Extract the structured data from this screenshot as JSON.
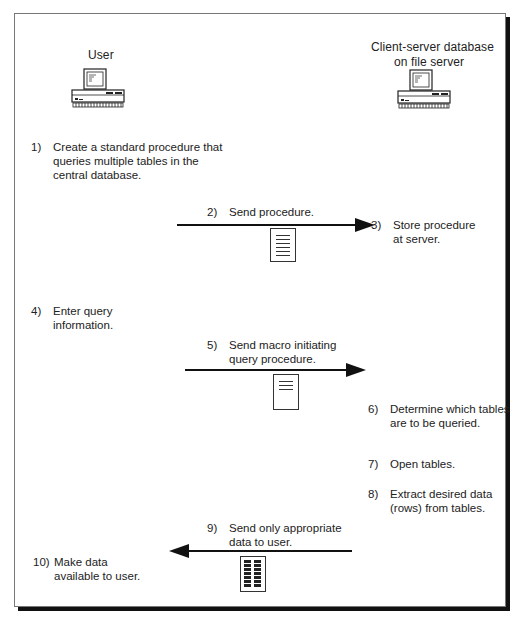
{
  "nodes": {
    "user": {
      "label": "User",
      "icon": "computer-icon"
    },
    "server": {
      "label_line1": "Client-server database",
      "label_line2": "on file server",
      "icon": "computer-icon"
    }
  },
  "steps": [
    {
      "num": "1)",
      "lines": [
        "Create a standard procedure that",
        "queries multiple tables in the",
        "central database."
      ]
    },
    {
      "num": "2)",
      "lines": [
        "Send procedure."
      ]
    },
    {
      "num": "3)",
      "lines": [
        "Store procedure",
        "at server."
      ]
    },
    {
      "num": "4)",
      "lines": [
        "Enter query",
        "information."
      ]
    },
    {
      "num": "5)",
      "lines": [
        "Send macro initiating",
        "query procedure."
      ]
    },
    {
      "num": "6)",
      "lines": [
        "Determine which tables",
        "are to be queried."
      ]
    },
    {
      "num": "7)",
      "lines": [
        "Open tables."
      ]
    },
    {
      "num": "8)",
      "lines": [
        "Extract desired data",
        "(rows) from tables."
      ]
    },
    {
      "num": "9)",
      "lines": [
        "Send only  appropriate",
        "data to user."
      ]
    },
    {
      "num": "10)",
      "lines": [
        "Make data",
        "available to user."
      ]
    }
  ],
  "arrows": [
    {
      "id": "send-procedure",
      "direction": "right",
      "payload_icon": "document-icon"
    },
    {
      "id": "send-macro",
      "direction": "right",
      "payload_icon": "document-icon"
    },
    {
      "id": "send-data",
      "direction": "left",
      "payload_icon": "table-data-icon"
    }
  ],
  "colors": {
    "line": "#111111",
    "text": "#222222",
    "border": "#777777"
  }
}
